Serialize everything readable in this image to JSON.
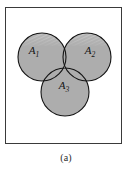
{
  "figure": {
    "caption": "(a)",
    "colors": {
      "circle_fill": "#adadad",
      "circle_fill_highlight": "#c9c9c9",
      "circle_stroke": "#151515",
      "box_stroke": "#3a3a3a",
      "background": "#ffffff",
      "label_color": "#141414"
    }
  },
  "sets": [
    {
      "id": "A1",
      "base": "A",
      "subscript": "1",
      "label": "A₁",
      "cx": 42,
      "cy": 57,
      "r": 24,
      "label_x": 34,
      "label_y": 54
    },
    {
      "id": "A2",
      "base": "A",
      "subscript": "2",
      "label": "A₂",
      "cx": 87,
      "cy": 57,
      "r": 24,
      "label_x": 87,
      "label_y": 54
    },
    {
      "id": "A3",
      "base": "A",
      "subscript": "3",
      "label": "A₃",
      "cx": 65,
      "cy": 92,
      "r": 24,
      "label_x": 59,
      "label_y": 88
    }
  ],
  "box": {
    "x": 5,
    "y": 7,
    "width": 117,
    "height": 137
  }
}
